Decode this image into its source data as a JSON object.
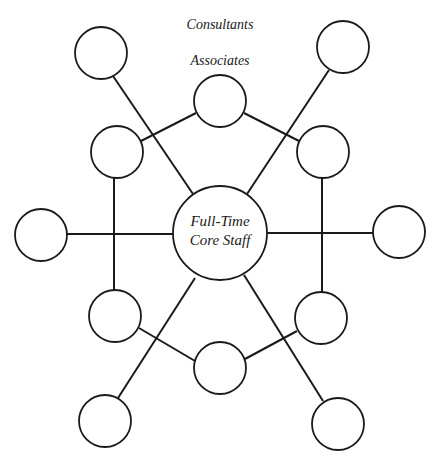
{
  "diagram": {
    "labels": {
      "outer_ring": "Consultants",
      "middle_ring": "Associates",
      "core_line1": "Full-Time",
      "core_line2": "Core Staff"
    },
    "colors": {
      "stroke": "#1a1a1a",
      "fill": "#ffffff",
      "background": "#ffffff"
    },
    "core_node": {
      "label": "Full-Time Core Staff",
      "cx": 220,
      "cy": 233,
      "r": 47
    },
    "associate_nodes": [
      {
        "id": "associate-top",
        "cx": 220,
        "cy": 101,
        "r": 26
      },
      {
        "id": "associate-upper-left",
        "cx": 117,
        "cy": 152,
        "r": 26
      },
      {
        "id": "associate-upper-right",
        "cx": 323,
        "cy": 152,
        "r": 26
      },
      {
        "id": "associate-lower-left",
        "cx": 115,
        "cy": 316,
        "r": 26
      },
      {
        "id": "associate-lower-right",
        "cx": 321,
        "cy": 318,
        "r": 26
      },
      {
        "id": "associate-bottom",
        "cx": 220,
        "cy": 368,
        "r": 26
      }
    ],
    "consultant_nodes": [
      {
        "id": "consultant-top-left",
        "cx": 101,
        "cy": 53,
        "r": 26
      },
      {
        "id": "consultant-top-right",
        "cx": 343,
        "cy": 47,
        "r": 26
      },
      {
        "id": "consultant-left",
        "cx": 41,
        "cy": 235,
        "r": 26
      },
      {
        "id": "consultant-right",
        "cx": 399,
        "cy": 232,
        "r": 26
      },
      {
        "id": "consultant-bottom-left",
        "cx": 105,
        "cy": 421,
        "r": 26
      },
      {
        "id": "consultant-bottom-right",
        "cx": 338,
        "cy": 424,
        "r": 26
      }
    ],
    "edges": [
      {
        "from": "associate-top",
        "to": "associate-upper-left"
      },
      {
        "from": "associate-top",
        "to": "associate-upper-right"
      },
      {
        "from": "associate-upper-left",
        "to": "associate-lower-left"
      },
      {
        "from": "associate-upper-right",
        "to": "associate-lower-right"
      },
      {
        "from": "associate-lower-left",
        "to": "associate-bottom"
      },
      {
        "from": "associate-lower-right",
        "to": "associate-bottom"
      },
      {
        "from": "consultant-top-left",
        "to": "core"
      },
      {
        "from": "consultant-top-right",
        "to": "core"
      },
      {
        "from": "consultant-left",
        "to": "core"
      },
      {
        "from": "consultant-right",
        "to": "core"
      },
      {
        "from": "consultant-bottom-left",
        "to": "core"
      },
      {
        "from": "consultant-bottom-right",
        "to": "core"
      }
    ]
  }
}
